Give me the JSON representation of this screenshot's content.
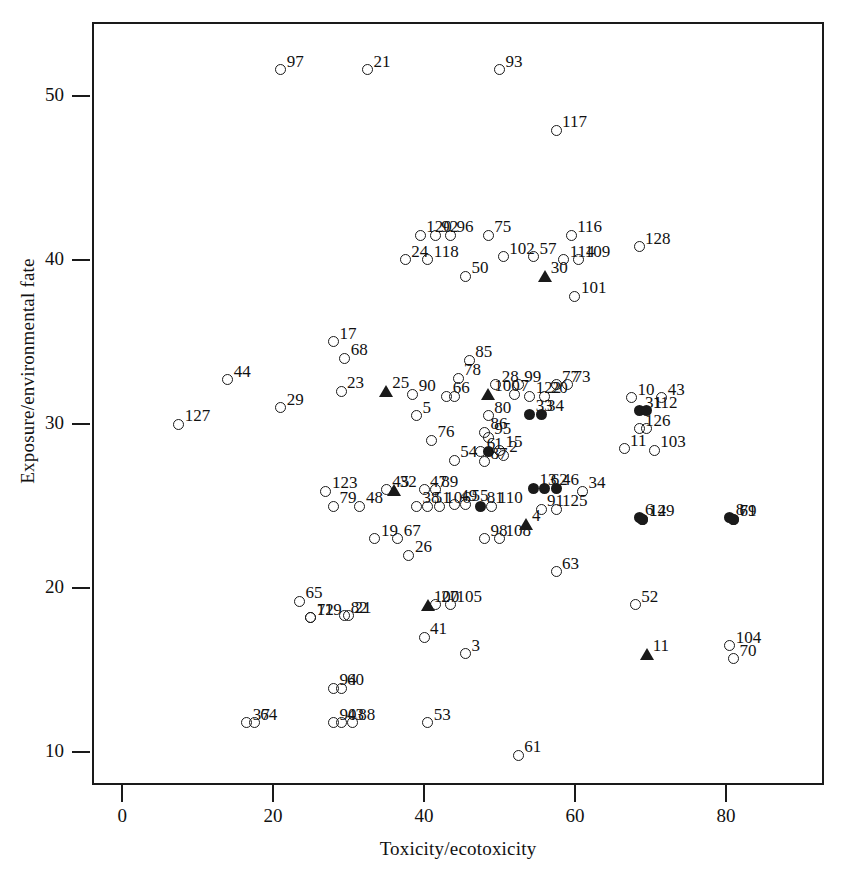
{
  "chart_data": {
    "type": "scatter",
    "title": "",
    "xlabel": "Toxicity/ecotoxicity",
    "ylabel": "Exposure/environmental fate",
    "xlim": [
      -4,
      93
    ],
    "ylim": [
      8.0,
      54.5
    ],
    "xticks": [
      0,
      20,
      40,
      60,
      80
    ],
    "yticks": [
      10,
      20,
      30,
      40,
      50
    ],
    "grid": false,
    "legend": null,
    "marker_types": [
      "open-circle",
      "filled-circle",
      "triangle"
    ],
    "points": [
      {
        "label": "97",
        "x": 21.0,
        "y": 51.6,
        "marker": "open-circle"
      },
      {
        "label": "21",
        "x": 32.5,
        "y": 51.6,
        "marker": "open-circle"
      },
      {
        "label": "93",
        "x": 50.0,
        "y": 51.6,
        "marker": "open-circle"
      },
      {
        "label": "117",
        "x": 57.5,
        "y": 47.9,
        "marker": "open-circle"
      },
      {
        "label": "120",
        "x": 39.5,
        "y": 41.5,
        "marker": "open-circle"
      },
      {
        "label": "92",
        "x": 41.5,
        "y": 41.5,
        "marker": "open-circle"
      },
      {
        "label": "96",
        "x": 43.5,
        "y": 41.5,
        "marker": "open-circle"
      },
      {
        "label": "75",
        "x": 48.5,
        "y": 41.5,
        "marker": "open-circle"
      },
      {
        "label": "116",
        "x": 59.5,
        "y": 41.5,
        "marker": "open-circle"
      },
      {
        "label": "128",
        "x": 68.5,
        "y": 40.8,
        "marker": "open-circle"
      },
      {
        "label": "24",
        "x": 37.5,
        "y": 40.0,
        "marker": "open-circle"
      },
      {
        "label": "118",
        "x": 40.5,
        "y": 40.0,
        "marker": "open-circle"
      },
      {
        "label": "102",
        "x": 50.5,
        "y": 40.2,
        "marker": "open-circle"
      },
      {
        "label": "57",
        "x": 54.5,
        "y": 40.2,
        "marker": "open-circle"
      },
      {
        "label": "114",
        "x": 58.5,
        "y": 40.0,
        "marker": "open-circle"
      },
      {
        "label": "109",
        "x": 60.5,
        "y": 40.0,
        "marker": "open-circle"
      },
      {
        "label": "50",
        "x": 45.5,
        "y": 39.0,
        "marker": "open-circle"
      },
      {
        "label": "30",
        "x": 56.0,
        "y": 39.0,
        "marker": "triangle"
      },
      {
        "label": "101",
        "x": 60.0,
        "y": 37.8,
        "marker": "open-circle"
      },
      {
        "label": "17",
        "x": 28.0,
        "y": 35.0,
        "marker": "open-circle"
      },
      {
        "label": "68",
        "x": 29.5,
        "y": 34.0,
        "marker": "open-circle"
      },
      {
        "label": "85",
        "x": 46.0,
        "y": 33.9,
        "marker": "open-circle"
      },
      {
        "label": "44",
        "x": 14.0,
        "y": 32.7,
        "marker": "open-circle"
      },
      {
        "label": "23",
        "x": 29.0,
        "y": 32.0,
        "marker": "open-circle"
      },
      {
        "label": "29",
        "x": 21.0,
        "y": 31.0,
        "marker": "open-circle"
      },
      {
        "label": "127",
        "x": 7.5,
        "y": 30.0,
        "marker": "open-circle"
      },
      {
        "label": "25",
        "x": 35.0,
        "y": 32.0,
        "marker": "triangle"
      },
      {
        "label": "90",
        "x": 38.5,
        "y": 31.8,
        "marker": "open-circle"
      },
      {
        "label": "66",
        "x": 43.0,
        "y": 31.7,
        "marker": "open-circle"
      },
      {
        "label": "65b",
        "x": 44.0,
        "y": 31.7,
        "marker": "open-circle"
      },
      {
        "label": "78",
        "x": 44.5,
        "y": 32.8,
        "marker": "open-circle"
      },
      {
        "label": "28",
        "x": 49.5,
        "y": 32.4,
        "marker": "open-circle"
      },
      {
        "label": "99",
        "x": 52.5,
        "y": 32.4,
        "marker": "open-circle"
      },
      {
        "label": "100",
        "x": 48.5,
        "y": 31.8,
        "marker": "triangle"
      },
      {
        "label": "7",
        "x": 52.0,
        "y": 31.8,
        "marker": "open-circle"
      },
      {
        "label": "77",
        "x": 57.5,
        "y": 32.4,
        "marker": "open-circle"
      },
      {
        "label": "73",
        "x": 59.0,
        "y": 32.4,
        "marker": "open-circle"
      },
      {
        "label": "122",
        "x": 54.0,
        "y": 31.7,
        "marker": "open-circle"
      },
      {
        "label": "20",
        "x": 56.0,
        "y": 31.7,
        "marker": "open-circle"
      },
      {
        "label": "10",
        "x": 67.5,
        "y": 31.6,
        "marker": "open-circle"
      },
      {
        "label": "43",
        "x": 71.5,
        "y": 31.6,
        "marker": "open-circle"
      },
      {
        "label": "5",
        "x": 39.0,
        "y": 30.5,
        "marker": "open-circle"
      },
      {
        "label": "80",
        "x": 48.5,
        "y": 30.5,
        "marker": "open-circle"
      },
      {
        "label": "33",
        "x": 54.0,
        "y": 30.6,
        "marker": "filled-circle"
      },
      {
        "label": "34b",
        "x": 55.5,
        "y": 30.6,
        "marker": "filled-circle"
      },
      {
        "label": "31",
        "x": 68.5,
        "y": 30.8,
        "marker": "filled-circle"
      },
      {
        "label": "112",
        "x": 69.5,
        "y": 30.8,
        "marker": "filled-circle"
      },
      {
        "label": "126",
        "x": 68.5,
        "y": 29.7,
        "marker": "open-circle"
      },
      {
        "label": "128b",
        "x": 69.5,
        "y": 29.7,
        "marker": "open-circle"
      },
      {
        "label": "76",
        "x": 41.0,
        "y": 29.0,
        "marker": "open-circle"
      },
      {
        "label": "86",
        "x": 48.0,
        "y": 29.5,
        "marker": "open-circle"
      },
      {
        "label": "95",
        "x": 48.5,
        "y": 29.2,
        "marker": "open-circle"
      },
      {
        "label": "6b",
        "x": 47.5,
        "y": 28.3,
        "marker": "open-circle"
      },
      {
        "label": "1",
        "x": 48.5,
        "y": 28.3,
        "marker": "filled-circle"
      },
      {
        "label": "15",
        "x": 50.0,
        "y": 28.4,
        "marker": "open-circle"
      },
      {
        "label": "2",
        "x": 50.5,
        "y": 28.1,
        "marker": "open-circle"
      },
      {
        "label": "11b",
        "x": 66.5,
        "y": 28.5,
        "marker": "open-circle"
      },
      {
        "label": "103",
        "x": 70.5,
        "y": 28.4,
        "marker": "open-circle"
      },
      {
        "label": "54",
        "x": 44.0,
        "y": 27.8,
        "marker": "open-circle"
      },
      {
        "label": "87",
        "x": 48.0,
        "y": 27.7,
        "marker": "open-circle"
      },
      {
        "label": "123",
        "x": 27.0,
        "y": 25.9,
        "marker": "open-circle"
      },
      {
        "label": "79",
        "x": 28.0,
        "y": 25.0,
        "marker": "open-circle"
      },
      {
        "label": "48",
        "x": 31.5,
        "y": 25.0,
        "marker": "open-circle"
      },
      {
        "label": "45",
        "x": 35.0,
        "y": 26.0,
        "marker": "open-circle"
      },
      {
        "label": "32",
        "x": 36.0,
        "y": 26.0,
        "marker": "triangle"
      },
      {
        "label": "47",
        "x": 40.0,
        "y": 26.0,
        "marker": "open-circle"
      },
      {
        "label": "89",
        "x": 41.5,
        "y": 26.0,
        "marker": "open-circle"
      },
      {
        "label": "38",
        "x": 39.0,
        "y": 25.0,
        "marker": "open-circle"
      },
      {
        "label": "51",
        "x": 40.5,
        "y": 25.0,
        "marker": "open-circle"
      },
      {
        "label": "106",
        "x": 42.0,
        "y": 25.0,
        "marker": "open-circle"
      },
      {
        "label": "49",
        "x": 44.0,
        "y": 25.1,
        "marker": "open-circle"
      },
      {
        "label": "55",
        "x": 45.5,
        "y": 25.1,
        "marker": "open-circle"
      },
      {
        "label": "81",
        "x": 47.5,
        "y": 25.0,
        "marker": "filled-circle"
      },
      {
        "label": "110",
        "x": 49.0,
        "y": 25.0,
        "marker": "open-circle"
      },
      {
        "label": "13",
        "x": 54.5,
        "y": 26.1,
        "marker": "filled-circle"
      },
      {
        "label": "62",
        "x": 56.0,
        "y": 26.1,
        "marker": "filled-circle"
      },
      {
        "label": "46",
        "x": 57.5,
        "y": 26.1,
        "marker": "filled-circle"
      },
      {
        "label": "34",
        "x": 61.0,
        "y": 25.9,
        "marker": "open-circle"
      },
      {
        "label": "91",
        "x": 55.5,
        "y": 24.8,
        "marker": "open-circle"
      },
      {
        "label": "125",
        "x": 57.5,
        "y": 24.8,
        "marker": "open-circle"
      },
      {
        "label": "6",
        "x": 68.5,
        "y": 24.3,
        "marker": "filled-circle"
      },
      {
        "label": "14",
        "x": 69.0,
        "y": 24.2,
        "marker": "filled-circle"
      },
      {
        "label": "129",
        "x": 69.0,
        "y": 24.2,
        "marker": "filled-circle"
      },
      {
        "label": "8",
        "x": 80.5,
        "y": 24.3,
        "marker": "filled-circle"
      },
      {
        "label": "69",
        "x": 81.0,
        "y": 24.2,
        "marker": "filled-circle"
      },
      {
        "label": "71",
        "x": 81.0,
        "y": 24.2,
        "marker": "filled-circle"
      },
      {
        "label": "19",
        "x": 33.5,
        "y": 23.0,
        "marker": "open-circle"
      },
      {
        "label": "67",
        "x": 36.5,
        "y": 23.0,
        "marker": "open-circle"
      },
      {
        "label": "26",
        "x": 38.0,
        "y": 22.0,
        "marker": "open-circle"
      },
      {
        "label": "98",
        "x": 48.0,
        "y": 23.0,
        "marker": "open-circle"
      },
      {
        "label": "108",
        "x": 50.0,
        "y": 23.0,
        "marker": "open-circle"
      },
      {
        "label": "4",
        "x": 53.5,
        "y": 23.9,
        "marker": "triangle"
      },
      {
        "label": "63",
        "x": 57.5,
        "y": 21.0,
        "marker": "open-circle"
      },
      {
        "label": "65",
        "x": 23.5,
        "y": 19.2,
        "marker": "open-circle"
      },
      {
        "label": "119",
        "x": 25.0,
        "y": 18.2,
        "marker": "open-circle"
      },
      {
        "label": "72",
        "x": 25.0,
        "y": 18.2,
        "marker": "open-circle"
      },
      {
        "label": "82",
        "x": 29.5,
        "y": 18.3,
        "marker": "open-circle"
      },
      {
        "label": "21b",
        "x": 30.0,
        "y": 18.3,
        "marker": "open-circle"
      },
      {
        "label": "100b",
        "x": 40.5,
        "y": 19.0,
        "marker": "triangle"
      },
      {
        "label": "27",
        "x": 41.5,
        "y": 19.0,
        "marker": "open-circle"
      },
      {
        "label": "105",
        "x": 43.5,
        "y": 19.0,
        "marker": "open-circle"
      },
      {
        "label": "52",
        "x": 68.0,
        "y": 19.0,
        "marker": "open-circle"
      },
      {
        "label": "41",
        "x": 40.0,
        "y": 17.0,
        "marker": "open-circle"
      },
      {
        "label": "3",
        "x": 45.5,
        "y": 16.0,
        "marker": "open-circle"
      },
      {
        "label": "11",
        "x": 69.5,
        "y": 16.0,
        "marker": "triangle"
      },
      {
        "label": "104",
        "x": 80.5,
        "y": 16.5,
        "marker": "open-circle"
      },
      {
        "label": "70",
        "x": 81.0,
        "y": 15.7,
        "marker": "open-circle"
      },
      {
        "label": "94",
        "x": 28.0,
        "y": 13.9,
        "marker": "open-circle"
      },
      {
        "label": "60",
        "x": 29.0,
        "y": 13.9,
        "marker": "open-circle"
      },
      {
        "label": "37",
        "x": 16.5,
        "y": 11.8,
        "marker": "open-circle"
      },
      {
        "label": "64",
        "x": 17.5,
        "y": 11.8,
        "marker": "open-circle"
      },
      {
        "label": "90b",
        "x": 28.0,
        "y": 11.8,
        "marker": "open-circle"
      },
      {
        "label": "43b",
        "x": 29.0,
        "y": 11.8,
        "marker": "open-circle"
      },
      {
        "label": "88",
        "x": 30.5,
        "y": 11.8,
        "marker": "open-circle"
      },
      {
        "label": "53",
        "x": 40.5,
        "y": 11.8,
        "marker": "open-circle"
      },
      {
        "label": "61",
        "x": 52.5,
        "y": 9.8,
        "marker": "open-circle"
      }
    ],
    "label_texts": {
      "97": "97",
      "21": "21",
      "93": "93",
      "117": "117",
      "120": "120",
      "92": "92",
      "96": "96",
      "75": "75",
      "116": "116",
      "128": "128",
      "24": "24",
      "118": "118",
      "102": "102",
      "57": "57",
      "114": "114",
      "109": "109",
      "50": "50",
      "30": "30",
      "101": "101",
      "17": "17",
      "68": "68",
      "85": "85",
      "44": "44",
      "23": "23",
      "29": "29",
      "127": "127",
      "25": "25",
      "90": "90",
      "66": "66",
      "65b": "",
      "78": "78",
      "28": "28",
      "99": "99",
      "100": "100",
      "7": "7",
      "77": "77",
      "73": "73",
      "122": "122",
      "20": "20",
      "10": "10",
      "43": "43",
      "5": "5",
      "80": "80",
      "33": "33",
      "34b": "34",
      "31": "31",
      "112": "112",
      "126": "126",
      "128b": "",
      "76": "76",
      "86": "86",
      "95": "95",
      "6b": "6",
      "1": "1",
      "15": "15",
      "2": "2",
      "11b": "11",
      "103": "103",
      "54": "54",
      "87": "87",
      "123": "123",
      "79": "79",
      "48": "48",
      "45": "45",
      "32": "32",
      "47": "47",
      "89": "89",
      "38": "38",
      "51": "51",
      "106": "106",
      "49": "49",
      "55": "55",
      "81": "81",
      "110": "110",
      "13": "13",
      "62": "62",
      "46": "46",
      "34": "34",
      "91": "91",
      "125": "125",
      "6": "6",
      "14": "14",
      "129": "129",
      "8": "8",
      "69": "69",
      "71": "71",
      "19": "19",
      "67": "67",
      "26": "26",
      "98": "98",
      "108": "108",
      "4": "4",
      "63": "63",
      "65": "65",
      "119": "119",
      "72": "72",
      "82": "82",
      "21b": "21",
      "100b": "100",
      "27": "27",
      "105": "105",
      "52": "52",
      "41": "41",
      "3": "3",
      "11": "11",
      "104": "104",
      "70": "70",
      "94": "94",
      "60": "60",
      "37": "37",
      "64": "64",
      "90b": "90",
      "43b": "43",
      "88": "88",
      "53": "53",
      "61": "61"
    }
  },
  "axes": {
    "x": {
      "label": "Toxicity/ecotoxicity",
      "ticks": [
        "0",
        "20",
        "40",
        "60",
        "80"
      ]
    },
    "y": {
      "label": "Exposure/environmental fate",
      "ticks": [
        "50",
        "40",
        "30",
        "20",
        "10"
      ]
    }
  }
}
